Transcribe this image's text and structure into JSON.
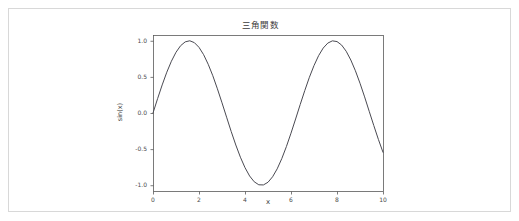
{
  "figure": {
    "background_color": "#ffffff",
    "border_color": "#d8d8d8"
  },
  "chart_data": {
    "type": "line",
    "title": "三角関数",
    "xlabel": "x",
    "ylabel": "sin(x)",
    "xlim": [
      0,
      10
    ],
    "ylim": [
      -1.08,
      1.08
    ],
    "xticks": [
      0,
      2,
      4,
      6,
      8,
      10
    ],
    "xticklabels": [
      "0",
      "2",
      "4",
      "6",
      "8",
      "10"
    ],
    "yticks": [
      -1.0,
      -0.5,
      0.0,
      0.5,
      1.0
    ],
    "yticklabels": [
      "-1.0",
      "-0.5",
      "0.0",
      "0.5",
      "1.0"
    ],
    "grid": false,
    "legend": null,
    "line_color": "#4a4a52",
    "line_width": 1.0,
    "axes_color": "#5a5a5a",
    "series": [
      {
        "name": "sin(x)",
        "formula": "sin(x)",
        "x": [
          0.0,
          0.2,
          0.4,
          0.6,
          0.8,
          1.0,
          1.2,
          1.4,
          1.6,
          1.8,
          2.0,
          2.2,
          2.4,
          2.6,
          2.8,
          3.0,
          3.2,
          3.4,
          3.6,
          3.8,
          4.0,
          4.2,
          4.4,
          4.6,
          4.8,
          5.0,
          5.2,
          5.4,
          5.6,
          5.8,
          6.0,
          6.2,
          6.4,
          6.6,
          6.8,
          7.0,
          7.2,
          7.4,
          7.6,
          7.8,
          8.0,
          8.2,
          8.4,
          8.6,
          8.8,
          9.0,
          9.2,
          9.4,
          9.6,
          9.8,
          10.0
        ],
        "y": [
          0.0,
          0.199,
          0.389,
          0.565,
          0.717,
          0.841,
          0.932,
          0.985,
          1.0,
          0.974,
          0.909,
          0.808,
          0.675,
          0.516,
          0.335,
          0.141,
          -0.058,
          -0.256,
          -0.443,
          -0.612,
          -0.757,
          -0.872,
          -0.952,
          -0.994,
          -0.996,
          -0.959,
          -0.883,
          -0.773,
          -0.631,
          -0.465,
          -0.279,
          -0.083,
          0.117,
          0.312,
          0.495,
          0.657,
          0.794,
          0.899,
          0.968,
          0.999,
          0.989,
          0.941,
          0.855,
          0.734,
          0.585,
          0.412,
          0.223,
          0.024,
          -0.174,
          -0.366,
          -0.544
        ]
      }
    ]
  }
}
